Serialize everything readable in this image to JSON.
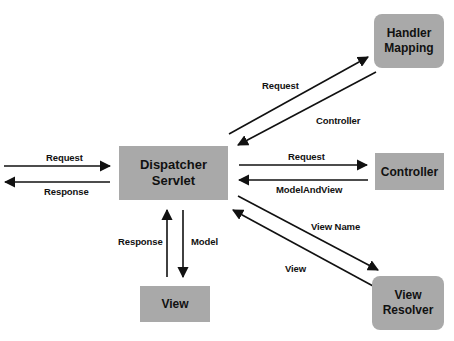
{
  "diagram": {
    "title": "",
    "nodes": [
      {
        "id": "dispatcher",
        "label_line1": "Dispatcher",
        "label_line2": "Servlet"
      },
      {
        "id": "handler_mapping",
        "label_line1": "Handler",
        "label_line2": "Mapping"
      },
      {
        "id": "controller",
        "label": "Controller"
      },
      {
        "id": "view",
        "label": "View"
      },
      {
        "id": "view_resolver",
        "label_line1": "View",
        "label_line2": "Resolver"
      }
    ],
    "edges": [
      {
        "from": "client",
        "to": "dispatcher",
        "label": "Request"
      },
      {
        "from": "dispatcher",
        "to": "client",
        "label": "Response"
      },
      {
        "from": "dispatcher",
        "to": "handler_mapping",
        "label": "Request"
      },
      {
        "from": "handler_mapping",
        "to": "dispatcher",
        "label": "Controller"
      },
      {
        "from": "dispatcher",
        "to": "controller",
        "label": "Request"
      },
      {
        "from": "controller",
        "to": "dispatcher",
        "label": "ModelAndView"
      },
      {
        "from": "dispatcher",
        "to": "view_resolver",
        "label": "View Name"
      },
      {
        "from": "view_resolver",
        "to": "dispatcher",
        "label": "View"
      },
      {
        "from": "view",
        "to": "dispatcher",
        "label": "Response"
      },
      {
        "from": "dispatcher",
        "to": "view",
        "label": "Model"
      }
    ],
    "colors": {
      "box_fill": "#a9a9a9",
      "arrow": "#111111",
      "text": "#111111"
    }
  }
}
